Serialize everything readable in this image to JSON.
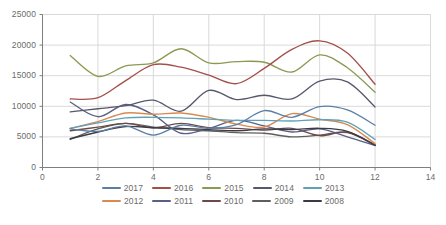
{
  "chart_data": {
    "type": "line",
    "title": "",
    "xlabel": "",
    "ylabel": "",
    "xlim": [
      0,
      14
    ],
    "ylim": [
      0,
      25000
    ],
    "grid": true,
    "legend_position": "bottom",
    "x_ticks": [
      "0",
      "2",
      "4",
      "6",
      "8",
      "10",
      "12",
      "14"
    ],
    "y_ticks": [
      "0",
      "5000",
      "10000",
      "15000",
      "20000",
      "25000"
    ],
    "x": [
      1,
      2,
      3,
      4,
      5,
      6,
      7,
      8,
      9,
      10,
      11,
      12
    ],
    "series": [
      {
        "name": "2017",
        "color": "#5b7fa6",
        "values": [
          6300,
          5900,
          6800,
          5300,
          6900,
          6400,
          7000,
          9300,
          8200,
          9950,
          9400,
          6900
        ]
      },
      {
        "name": "2016",
        "color": "#a4504a",
        "values": [
          11200,
          11400,
          14200,
          16800,
          16400,
          15100,
          13700,
          16200,
          19300,
          20700,
          18700,
          13600
        ]
      },
      {
        "name": "2015",
        "color": "#8a9a52",
        "values": [
          18300,
          14900,
          16600,
          17100,
          19400,
          17100,
          17300,
          17200,
          15600,
          18400,
          16300,
          12300
        ]
      },
      {
        "name": "2014",
        "color": "#56586b",
        "values": [
          9100,
          9600,
          10100,
          11000,
          9200,
          12600,
          11100,
          11800,
          11200,
          14100,
          14000,
          9900
        ]
      },
      {
        "name": "2013",
        "color": "#5fa2b8",
        "values": [
          6400,
          7300,
          8100,
          8200,
          8100,
          7900,
          7700,
          7700,
          7600,
          7800,
          7400,
          4600
        ]
      },
      {
        "name": "2012",
        "color": "#d98a52",
        "values": [
          6400,
          7500,
          8900,
          8700,
          8900,
          8200,
          7100,
          6600,
          8800,
          7900,
          7000,
          3900
        ]
      },
      {
        "name": "2011",
        "color": "#5a5f8a",
        "values": [
          10700,
          8300,
          10300,
          8600,
          5600,
          6400,
          7700,
          6800,
          5800,
          6300,
          5000,
          3600
        ]
      },
      {
        "name": "2010",
        "color": "#6e4a46",
        "values": [
          6000,
          6600,
          7200,
          6500,
          7200,
          6500,
          6400,
          6100,
          6400,
          5200,
          5800,
          3700
        ]
      },
      {
        "name": "2009",
        "color": "#5e5e5e",
        "values": [
          4600,
          6300,
          7200,
          6600,
          6200,
          6000,
          5700,
          5600,
          5000,
          5300,
          5700,
          3700
        ]
      },
      {
        "name": "2008",
        "color": "#3b3b45",
        "values": [
          4700,
          5800,
          6700,
          6500,
          6400,
          6200,
          6000,
          6300,
          6200,
          6400,
          5900,
          3600
        ]
      }
    ]
  },
  "legend": {
    "rows": [
      [
        "2017",
        "2016",
        "2015",
        "2014",
        "2013"
      ],
      [
        "2012",
        "2011",
        "2010",
        "2009",
        "2008"
      ]
    ]
  },
  "colors": {
    "axis": "#7f7f7f",
    "grid": "#d9d9d9",
    "tick_text": "#6b6b6b",
    "background": "#ffffff"
  }
}
